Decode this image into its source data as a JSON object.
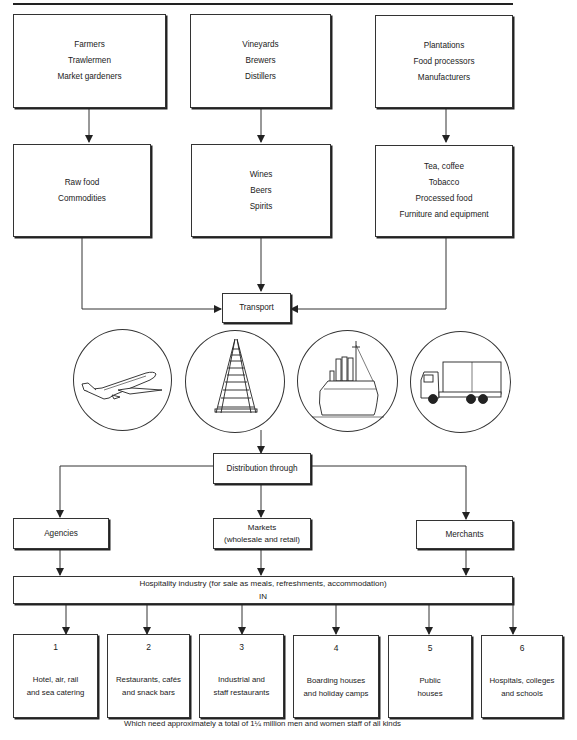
{
  "diagram": {
    "producers": [
      {
        "lines": [
          "Farmers",
          "Trawlermen",
          "Market gardeners"
        ]
      },
      {
        "lines": [
          "Vineyards",
          "Brewers",
          "Distillers"
        ]
      },
      {
        "lines": [
          "Plantations",
          "Food processors",
          "Manufacturers"
        ]
      }
    ],
    "products": [
      {
        "lines": [
          "Raw food",
          "Commodities"
        ]
      },
      {
        "lines": [
          "Wines",
          "Beers",
          "Spirits"
        ]
      },
      {
        "lines": [
          "Tea, coffee",
          "Tobacco",
          "Processed food",
          "Furniture and equipment"
        ]
      }
    ],
    "transport": {
      "label": "Transport",
      "modes": [
        "airplane-icon",
        "railway-track-icon",
        "ship-icon",
        "lorry-icon"
      ]
    },
    "distribution": {
      "label": "Distribution through",
      "channels": [
        {
          "lines": [
            "Agencies"
          ]
        },
        {
          "lines": [
            "Markets",
            "(wholesale and retail)"
          ]
        },
        {
          "lines": [
            "Merchants"
          ]
        }
      ]
    },
    "hospitality": {
      "title": "Hospitality industry (for sale as meals, refreshments, accommodation)",
      "subtitle": "IN"
    },
    "sectors": [
      {
        "number": "1",
        "lines": [
          "Hotel, air, rail",
          "and sea catering"
        ]
      },
      {
        "number": "2",
        "lines": [
          "Restaurants, cafés",
          "and snack bars"
        ]
      },
      {
        "number": "3",
        "lines": [
          "Industrial and",
          "staff restaurants"
        ]
      },
      {
        "number": "4",
        "lines": [
          "Boarding houses",
          "and holiday camps"
        ]
      },
      {
        "number": "5",
        "lines": [
          "Public",
          "houses"
        ]
      },
      {
        "number": "6",
        "lines": [
          "Hospitals, colleges",
          "and schools"
        ]
      }
    ],
    "footer": "Which need approximately a total of 1¼ million men and women staff of all kinds"
  }
}
